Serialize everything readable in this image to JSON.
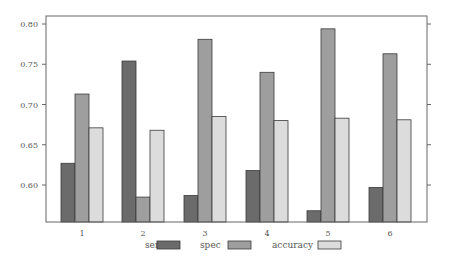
{
  "chart_data": {
    "type": "bar",
    "title": "",
    "xlabel": "",
    "ylabel": "",
    "categories": [
      "1",
      "2",
      "3",
      "4",
      "5",
      "6"
    ],
    "series": [
      {
        "name": "sens",
        "color": "#6b6b6b",
        "values": [
          0.627,
          0.754,
          0.587,
          0.618,
          0.568,
          0.597
        ]
      },
      {
        "name": "spec",
        "color": "#9e9e9e",
        "values": [
          0.713,
          0.585,
          0.781,
          0.74,
          0.794,
          0.763
        ]
      },
      {
        "name": "accuracy",
        "color": "#dcdcdc",
        "values": [
          0.671,
          0.668,
          0.685,
          0.68,
          0.683,
          0.681
        ]
      }
    ],
    "ylim": [
      0.554,
      0.81
    ],
    "yticks": [
      "0.60",
      "0.65",
      "0.70",
      "0.75",
      "0.80"
    ],
    "grid": false,
    "legend_position": "bottom"
  },
  "legend": {
    "items": [
      {
        "label": "sens"
      },
      {
        "label": "spec"
      },
      {
        "label": "accuracy"
      }
    ]
  }
}
